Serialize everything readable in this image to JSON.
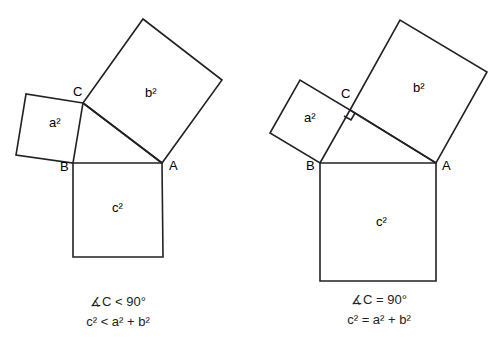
{
  "figures": [
    {
      "id": "acute",
      "squares": {
        "a": "a²",
        "b": "b²",
        "c": "c²"
      },
      "vertices": {
        "A": "A",
        "B": "B",
        "C": "C"
      },
      "caption_line1": "∡C < 90°",
      "caption_line2": "c² < a² + b²"
    },
    {
      "id": "right",
      "squares": {
        "a": "a²",
        "b": "b²",
        "c": "c²"
      },
      "vertices": {
        "A": "A",
        "B": "B",
        "C": "C"
      },
      "caption_line1": "∡C = 90°",
      "caption_line2": "c² = a² + b²"
    }
  ],
  "colors": {
    "stroke": "#222222",
    "background": "#ffffff"
  }
}
